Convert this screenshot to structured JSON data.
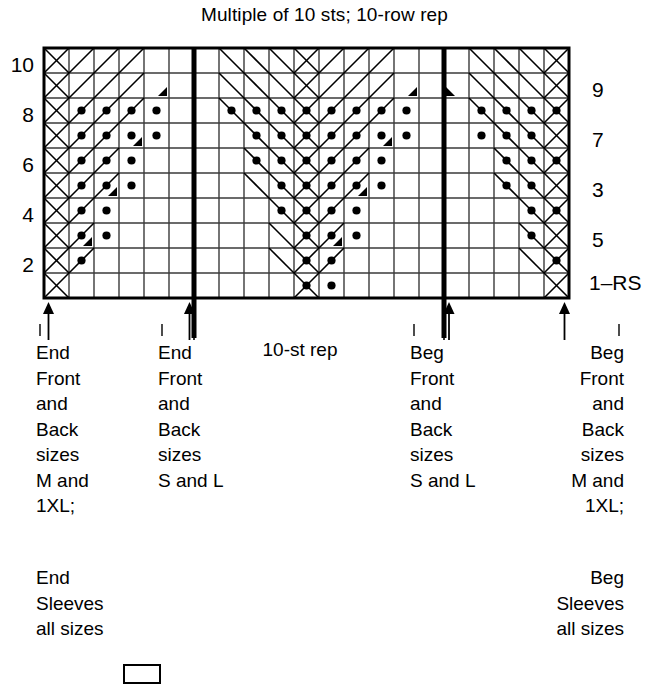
{
  "title": "Multiple of 10 sts; 10-row rep",
  "chart_data": {
    "type": "table",
    "title": "Multiple of 10 sts; 10-row rep",
    "grid": {
      "columns": 21,
      "rows": 10,
      "cell": 25
    },
    "row_labels_left": [
      "10",
      "8",
      "6",
      "4",
      "2"
    ],
    "row_labels_right": [
      "9",
      "7",
      "3",
      "5",
      "1–RS"
    ],
    "repeat_label": "10-st rep",
    "repeat_columns": [
      6,
      16
    ],
    "legend_symbols": [
      "purl-dot",
      "left-slant-decrease",
      "right-slant-decrease"
    ],
    "purl_cells": [
      {
        "row": 8,
        "cols": [
          1,
          2,
          3,
          4,
          7,
          8,
          9,
          10,
          11,
          12,
          13,
          14,
          17,
          18,
          19,
          20
        ]
      },
      {
        "row": 7,
        "cols": [
          1,
          2,
          3,
          4,
          8,
          9,
          10,
          11,
          12,
          13,
          14,
          17,
          18,
          19
        ]
      },
      {
        "row": 6,
        "cols": [
          1,
          2,
          3,
          8,
          9,
          10,
          11,
          12,
          13,
          18,
          19,
          20
        ]
      },
      {
        "row": 5,
        "cols": [
          1,
          2,
          3,
          9,
          10,
          11,
          12,
          13,
          18,
          19
        ]
      },
      {
        "row": 4,
        "cols": [
          1,
          2,
          9,
          10,
          11,
          12,
          19,
          20
        ]
      },
      {
        "row": 3,
        "cols": [
          1,
          2,
          10,
          11,
          12,
          19
        ]
      },
      {
        "row": 2,
        "cols": [
          1,
          10,
          11,
          20
        ]
      },
      {
        "row": 1,
        "cols": [
          10,
          11
        ]
      }
    ],
    "decrease_marks": [
      {
        "row": 9,
        "col": 14,
        "dir": "left"
      },
      {
        "row": 9,
        "col": 4,
        "dir": "left"
      },
      {
        "row": 9,
        "col": 16,
        "dir": "right"
      },
      {
        "row": 7,
        "col": 13,
        "dir": "left"
      },
      {
        "row": 7,
        "col": 3,
        "dir": "left"
      },
      {
        "row": 5,
        "col": 12,
        "dir": "left"
      },
      {
        "row": 5,
        "col": 2,
        "dir": "left"
      },
      {
        "row": 3,
        "col": 11,
        "dir": "left"
      },
      {
        "row": 3,
        "col": 1,
        "dir": "left"
      }
    ]
  },
  "arrows": [
    {
      "name": "arrow-end-front-back-M-1XL",
      "label": "End\nFront\nand\nBack\nsizes\nM and\n1XL;\n\nEnd\nSleeves\nall sizes"
    },
    {
      "name": "arrow-end-front-back-S-L",
      "label": "End\nFront\nand\nBack\nsizes\nS and L"
    },
    {
      "name": "arrow-beg-front-back-S-L",
      "label": "Beg\nFront\nand\nBack\nsizes\nS and L"
    },
    {
      "name": "arrow-beg-front-back-M-1XL",
      "label": "Beg\nFront\nand\nBack\nsizes\nM and\n1XL;\n\nBeg\nSleeves\nall sizes"
    }
  ],
  "captions": {
    "end_mb_1": "End\nFront\nand\nBack\nsizes\nM and\n1XL;",
    "end_mb_2": "End\nSleeves\nall sizes",
    "end_sl": "End\nFront\nand\nBack\nsizes\nS and L",
    "beg_sl": "Beg\nFront\nand\nBack\nsizes\nS and L",
    "beg_mb_1": "Beg\nFront\nand\nBack\nsizes\nM and\n1XL;",
    "beg_mb_2": "Beg\nSleeves\nall sizes",
    "step_rep": "10-st rep"
  },
  "colors": {
    "ink": "#000000",
    "grid": "#3a3a3a",
    "background": "#ffffff"
  }
}
